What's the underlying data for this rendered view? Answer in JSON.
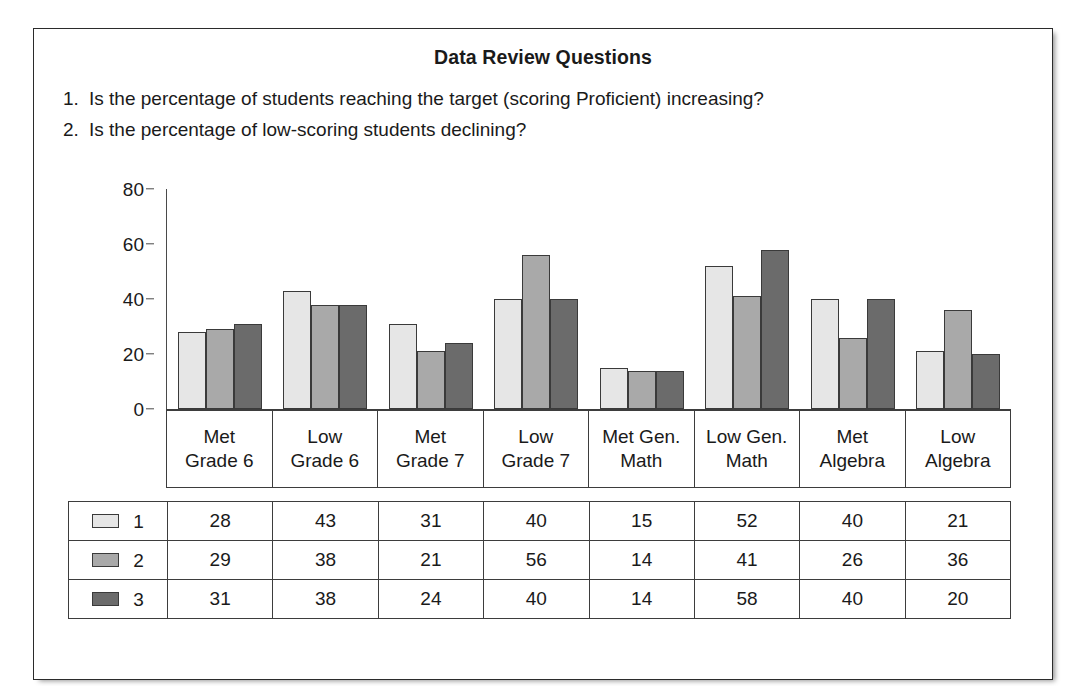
{
  "document": {
    "title": "Data Review Questions",
    "questions": [
      {
        "number": "1.",
        "text": "Is the percentage of students reaching the target (scoring Proficient) increasing?"
      },
      {
        "number": "2.",
        "text": "Is the percentage of low-scoring students declining?"
      }
    ]
  },
  "chart_data": {
    "type": "bar",
    "title": "",
    "xlabel": "",
    "ylabel": "",
    "ylim": [
      0,
      80
    ],
    "yticks": [
      0,
      20,
      40,
      60,
      80
    ],
    "grid": false,
    "legend_position": "table-left",
    "categories": [
      "Met\nGrade 6",
      "Low\nGrade 6",
      "Met\nGrade 7",
      "Low\nGrade 7",
      "Met Gen.\nMath",
      "Low Gen.\nMath",
      "Met\nAlgebra",
      "Low\nAlgebra"
    ],
    "category_lines": [
      [
        "Met",
        "Grade 6"
      ],
      [
        "Low",
        "Grade 6"
      ],
      [
        "Met",
        "Grade 7"
      ],
      [
        "Low",
        "Grade 7"
      ],
      [
        "Met Gen.",
        "Math"
      ],
      [
        "Low Gen.",
        "Math"
      ],
      [
        "Met",
        "Algebra"
      ],
      [
        "Low",
        "Algebra"
      ]
    ],
    "series": [
      {
        "name": "1",
        "color": "#e6e6e6",
        "values": [
          28,
          43,
          31,
          40,
          15,
          52,
          40,
          21
        ]
      },
      {
        "name": "2",
        "color": "#a9a9a9",
        "values": [
          29,
          38,
          21,
          56,
          14,
          41,
          26,
          36
        ]
      },
      {
        "name": "3",
        "color": "#6b6b6b",
        "values": [
          31,
          38,
          24,
          40,
          14,
          58,
          40,
          20
        ]
      }
    ]
  },
  "table": {
    "rows": [
      {
        "series": "1",
        "swatch": "series-1-swatch",
        "values": [
          "28",
          "43",
          "31",
          "40",
          "15",
          "52",
          "40",
          "21"
        ]
      },
      {
        "series": "2",
        "swatch": "series-2-swatch",
        "values": [
          "29",
          "38",
          "21",
          "56",
          "14",
          "41",
          "26",
          "36"
        ]
      },
      {
        "series": "3",
        "swatch": "series-3-swatch",
        "values": [
          "31",
          "38",
          "24",
          "40",
          "14",
          "58",
          "40",
          "20"
        ]
      }
    ]
  },
  "colors": {
    "series_1": "#e6e6e6",
    "series_2": "#a9a9a9",
    "series_3": "#6b6b6b",
    "border": "#3d3d3d",
    "text": "#1a1a1a"
  }
}
